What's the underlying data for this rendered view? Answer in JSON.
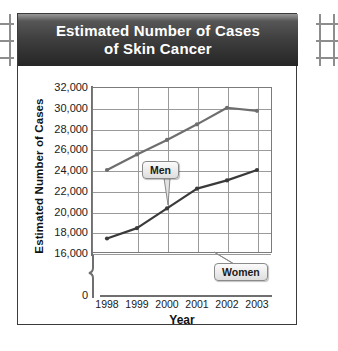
{
  "decorations": {
    "left_ruler": "notebook-ruler-mark",
    "right_ruler": "notebook-ruler-mark"
  },
  "title": {
    "line1": "Estimated Number of Cases",
    "line2": "of Skin Cancer"
  },
  "axes": {
    "ylabel": "Estimated Number of Cases",
    "xlabel": "Year",
    "zero_tick": "0",
    "yticks": [
      "32,000",
      "30,000",
      "28,000",
      "26,000",
      "24,000",
      "22,000",
      "20,000",
      "18,000",
      "16,000"
    ],
    "xticks": [
      "1998",
      "1999",
      "2000",
      "2001",
      "2002",
      "2003"
    ]
  },
  "labels": {
    "men": "Men",
    "women": "Women"
  },
  "colors": {
    "banner_dark": "#2e2e2e",
    "banner_light": "#6b6b6b",
    "men_line": "#6e6e6e",
    "women_line": "#3a3a3a",
    "grid": "#9a9a9a",
    "axis": "#6f6f6f",
    "card_border": "#3b3b3b",
    "callout_fill": "#ededed"
  },
  "chart_data": {
    "type": "line",
    "title": "Estimated Number of Cases of Skin Cancer",
    "xlabel": "Year",
    "ylabel": "Estimated Number of Cases",
    "x": [
      1998,
      1999,
      2000,
      2001,
      2002,
      2003
    ],
    "categories": [
      "1998",
      "1999",
      "2000",
      "2001",
      "2002",
      "2003"
    ],
    "series": [
      {
        "name": "Men",
        "values": [
          24000,
          25500,
          26900,
          28400,
          30000,
          29700
        ]
      },
      {
        "name": "Women",
        "values": [
          17400,
          18400,
          20300,
          22200,
          23000,
          24000
        ]
      }
    ],
    "ylim": [
      16000,
      32000
    ],
    "ytick_step": 2000,
    "y_axis_break": true,
    "y_axis_break_note": "axis broken between 0 and 16,000",
    "grid": true,
    "legend": "inline-callouts",
    "markers": true
  }
}
